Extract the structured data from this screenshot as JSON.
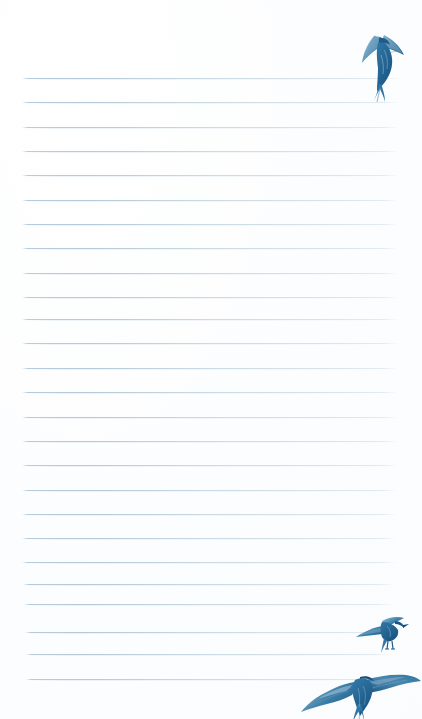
{
  "page": {
    "kind": "lined-notepaper",
    "width": 422,
    "height": 719,
    "background_color": "#fdfdfd",
    "text_content": ""
  },
  "colors": {
    "paper": "#fdfdfd",
    "rule_line": "#b2c7d7",
    "rule_line_light": "#dee9f1",
    "bird_dark": "#1e5b8a",
    "bird_mid": "#2f76a4",
    "bird_accent": "#3d7fa8",
    "bird_light": "#7ba8c4",
    "bird_pale": "#a8c8dc"
  },
  "rules": {
    "label": "Ruled writing lines",
    "count": 26,
    "first_y": 78,
    "spacing": 24.35,
    "left_x": 22,
    "right_x": 400,
    "lines": [
      {
        "y": 78,
        "x1": 22,
        "x2": 400
      },
      {
        "y": 102,
        "x1": 22,
        "x2": 398
      },
      {
        "y": 127,
        "x1": 22,
        "x2": 398
      },
      {
        "y": 151,
        "x1": 22,
        "x2": 399
      },
      {
        "y": 175,
        "x1": 22,
        "x2": 398
      },
      {
        "y": 200,
        "x1": 22,
        "x2": 398
      },
      {
        "y": 224,
        "x1": 22,
        "x2": 398
      },
      {
        "y": 248,
        "x1": 22,
        "x2": 398
      },
      {
        "y": 273,
        "x1": 22,
        "x2": 398
      },
      {
        "y": 297,
        "x1": 22,
        "x2": 398
      },
      {
        "y": 319,
        "x1": 22,
        "x2": 398
      },
      {
        "y": 343,
        "x1": 22,
        "x2": 398
      },
      {
        "y": 368,
        "x1": 22,
        "x2": 398
      },
      {
        "y": 392,
        "x1": 22,
        "x2": 398
      },
      {
        "y": 417,
        "x1": 22,
        "x2": 398
      },
      {
        "y": 441,
        "x1": 22,
        "x2": 398
      },
      {
        "y": 465,
        "x1": 22,
        "x2": 397
      },
      {
        "y": 490,
        "x1": 22,
        "x2": 397
      },
      {
        "y": 514,
        "x1": 22,
        "x2": 397
      },
      {
        "y": 538,
        "x1": 22,
        "x2": 396
      },
      {
        "y": 562,
        "x1": 22,
        "x2": 396
      },
      {
        "y": 584,
        "x1": 23,
        "x2": 394
      },
      {
        "y": 604,
        "x1": 24,
        "x2": 392
      },
      {
        "y": 632,
        "x1": 25,
        "x2": 390
      },
      {
        "y": 654,
        "x1": 26,
        "x2": 388
      },
      {
        "y": 679,
        "x1": 26,
        "x2": 380
      }
    ]
  },
  "illustrations": [
    {
      "id": "bird-top",
      "name": "swallow-diving",
      "description": "Watercolour swallow diving downward with wings raised",
      "x": 340,
      "y": 22,
      "width": 78,
      "height": 80
    },
    {
      "id": "bird-middle",
      "name": "swallow-perched",
      "description": "Watercolour swallow gliding, wings swept back",
      "x": 352,
      "y": 612,
      "width": 60,
      "height": 44
    },
    {
      "id": "bird-bottom",
      "name": "swallow-soaring",
      "description": "Watercolour swallow soaring with wings fully spread",
      "x": 296,
      "y": 664,
      "width": 126,
      "height": 58
    }
  ]
}
